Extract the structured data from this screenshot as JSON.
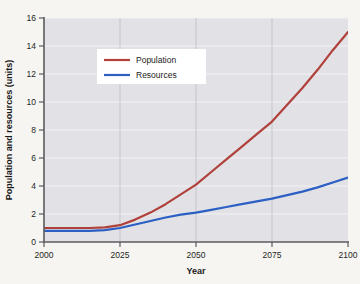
{
  "figure": {
    "background_color": "#f6f5f1",
    "plot_background_color": "#e2e1e6",
    "axis_color": "#5b5b60",
    "grid_color": "#f2f2f4"
  },
  "legend": {
    "position": "upper-left-inner",
    "background_color": "#ffffff",
    "entries": [
      {
        "label": "Population",
        "color": "#b0403a"
      },
      {
        "label": "Resources",
        "color": "#2b5fc4"
      }
    ]
  },
  "chart_data": {
    "type": "line",
    "title": "",
    "xlabel": "Year",
    "ylabel": "Population and resources (units)",
    "xlim": [
      2000,
      2100
    ],
    "ylim": [
      0,
      16
    ],
    "xticks": [
      2000,
      2025,
      2050,
      2075,
      2100
    ],
    "xtick_labels": [
      "2000",
      "2025",
      "2050",
      "2075",
      "2100"
    ],
    "yticks": [
      0,
      2,
      4,
      6,
      8,
      10,
      12,
      14,
      16
    ],
    "ytick_labels": [
      "0",
      "2",
      "4",
      "6",
      "8",
      "10",
      "12",
      "14",
      "16"
    ],
    "grid": true,
    "grid_axis": "y",
    "legend_position": "upper left",
    "x": [
      2000,
      2005,
      2010,
      2015,
      2020,
      2025,
      2030,
      2035,
      2040,
      2045,
      2050,
      2055,
      2060,
      2065,
      2070,
      2075,
      2080,
      2085,
      2090,
      2095,
      2100
    ],
    "series": [
      {
        "name": "Population",
        "color": "#b0403a",
        "line_width": 2.2,
        "values": [
          1.0,
          1.0,
          1.0,
          1.0,
          1.05,
          1.2,
          1.6,
          2.1,
          2.7,
          3.4,
          4.1,
          5.0,
          5.9,
          6.8,
          7.7,
          8.6,
          9.8,
          11.0,
          12.3,
          13.7,
          15.0
        ]
      },
      {
        "name": "Resources",
        "color": "#2b5fc4",
        "line_width": 2.2,
        "values": [
          0.8,
          0.8,
          0.8,
          0.8,
          0.85,
          1.0,
          1.25,
          1.5,
          1.75,
          1.95,
          2.1,
          2.3,
          2.5,
          2.7,
          2.9,
          3.1,
          3.35,
          3.6,
          3.9,
          4.25,
          4.6
        ]
      }
    ]
  }
}
